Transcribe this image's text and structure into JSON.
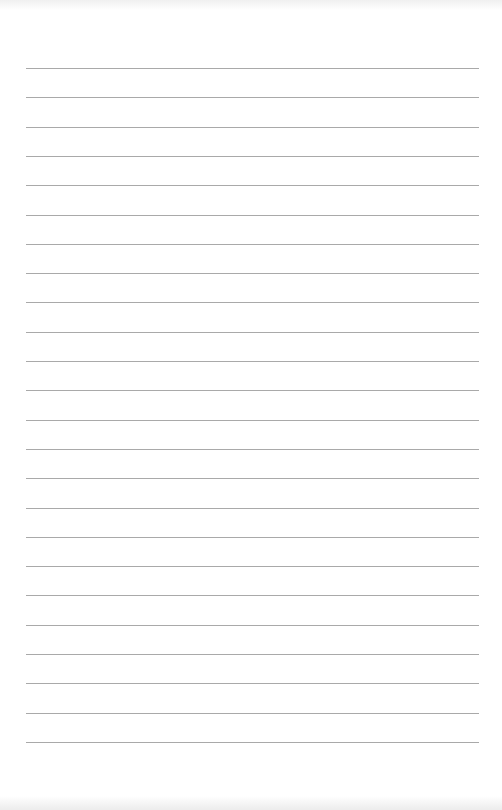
{
  "page": {
    "type": "lined-paper",
    "background_color": "#ffffff",
    "line_color": "#a9a9a9",
    "line_count": 24,
    "first_line_y": 68,
    "line_spacing": 29.3,
    "line_left": 26,
    "line_width": 453
  }
}
